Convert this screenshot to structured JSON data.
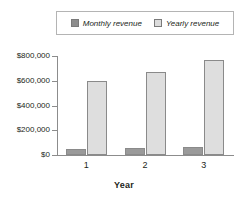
{
  "chart_data": {
    "type": "bar",
    "title": "",
    "xlabel": "Year",
    "ylabel": "",
    "categories": [
      "1",
      "2",
      "3"
    ],
    "series": [
      {
        "name": "Monthly revenue",
        "color": "#9a9a9a",
        "values": [
          45000,
          55000,
          65000
        ]
      },
      {
        "name": "Yearly revenue",
        "color": "#dedede",
        "values": [
          595000,
          670000,
          765000
        ]
      }
    ],
    "ylim": [
      0,
      800000
    ],
    "ytick_values": [
      0,
      200000,
      400000,
      600000,
      800000
    ],
    "ytick_labels": [
      "$0",
      "$200,000",
      "$400,000",
      "$600,000",
      "$800,000"
    ],
    "grid": false,
    "legend_position": "top"
  },
  "legend": {
    "entries": [
      {
        "label": "Monthly revenue",
        "swatch": "legend-swatch-monthly"
      },
      {
        "label": "Yearly revenue",
        "swatch": "legend-swatch-yearly"
      }
    ]
  },
  "axis": {
    "x_title": "Year"
  }
}
